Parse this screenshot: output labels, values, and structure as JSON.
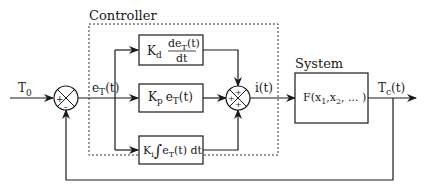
{
  "diagram": {
    "type": "PID control loop block diagram",
    "controller_label": "Controller",
    "system_label": "System",
    "input_signal": {
      "base": "T",
      "sub": "0"
    },
    "error_signal": {
      "base": "e",
      "sub": "T",
      "tail": "(t)"
    },
    "control_signal": "i(t)",
    "output_signal": {
      "base": "T",
      "sub": "c",
      "tail": "(t)"
    },
    "summing_junction_1": {
      "signs": [
        "+",
        "-"
      ]
    },
    "summing_junction_2": {
      "signs": [
        "+",
        "+",
        "+"
      ]
    },
    "blocks": {
      "derivative": {
        "gain": "K",
        "gain_sub": "d",
        "num": "de",
        "num_sub": "T",
        "num_tail": "(t)",
        "den": "dt"
      },
      "proportional": {
        "gain": "K",
        "gain_sub": "p",
        "expr": "e",
        "expr_sub": "T",
        "expr_tail": "(t)"
      },
      "integral": {
        "gain": "K",
        "gain_sub": "i",
        "integral_sign": "∫",
        "expr": "e",
        "expr_sub": "T",
        "expr_tail": "(t) dt"
      },
      "system": {
        "fn": "F(x",
        "sub1": "1",
        "mid": ",x",
        "sub2": "2",
        "tail": ", ... )"
      }
    },
    "colors": {
      "line": "#1a1a1a",
      "background": "#ffffff"
    }
  }
}
